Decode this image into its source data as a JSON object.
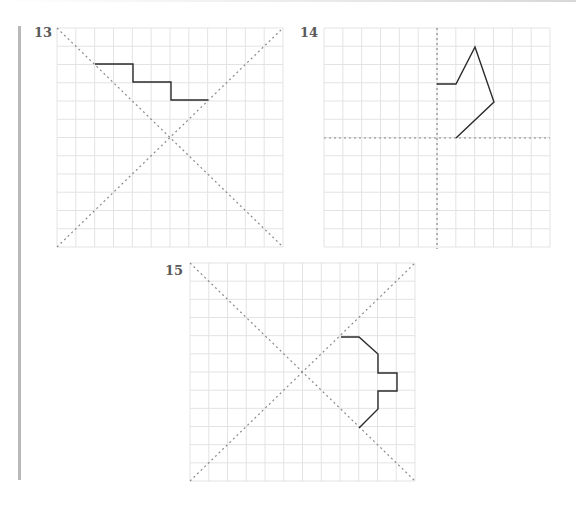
{
  "colors": {
    "grid": "#e3e3e3",
    "axis": "#8a8a8a",
    "shape": "#2a2a2a",
    "label": "#5a5a5a",
    "bar": "#b8b8b8"
  },
  "exercises": [
    {
      "number": "13",
      "label_pos": [
        34,
        26
      ],
      "grid": {
        "x": 57,
        "y": 28,
        "cols": 12,
        "rows": 12,
        "width": 226,
        "height": 219
      },
      "axes_type": "diagonals",
      "axes": [
        [
          57,
          28,
          283,
          247
        ],
        [
          57,
          247,
          283,
          28
        ]
      ],
      "shape": [
        [
          95,
          64
        ],
        [
          133,
          64
        ],
        [
          133,
          82
        ],
        [
          171,
          82
        ],
        [
          171,
          100
        ],
        [
          208,
          100
        ]
      ]
    },
    {
      "number": "14",
      "label_pos": [
        300,
        26
      ],
      "grid": {
        "x": 324,
        "y": 28,
        "cols": 12,
        "rows": 12,
        "width": 226,
        "height": 219
      },
      "axes_type": "cross",
      "axes": [
        [
          437,
          28,
          437,
          249
        ],
        [
          324,
          138,
          550,
          138
        ]
      ],
      "shape": [
        [
          437,
          84
        ],
        [
          456,
          84
        ],
        [
          475,
          47
        ],
        [
          494,
          102
        ],
        [
          456,
          138
        ]
      ]
    },
    {
      "number": "15",
      "label_pos": [
        165,
        264
      ],
      "grid": {
        "x": 190,
        "y": 263,
        "cols": 12,
        "rows": 12,
        "width": 225,
        "height": 218
      },
      "axes_type": "diagonals",
      "axes": [
        [
          190,
          263,
          415,
          481
        ],
        [
          190,
          481,
          415,
          263
        ]
      ],
      "shape": [
        [
          341,
          337
        ],
        [
          359,
          337
        ],
        [
          378,
          354
        ],
        [
          378,
          373
        ],
        [
          397,
          373
        ],
        [
          397,
          391
        ],
        [
          378,
          391
        ],
        [
          378,
          409
        ],
        [
          359,
          428
        ]
      ]
    }
  ]
}
